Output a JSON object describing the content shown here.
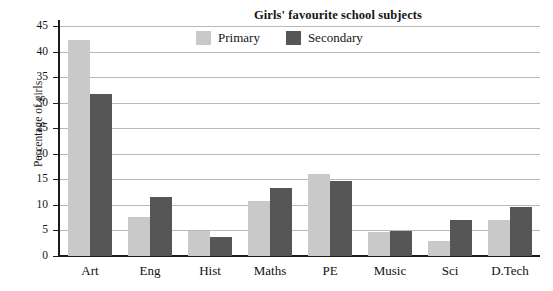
{
  "chart_data": {
    "type": "bar",
    "title": "Girls' favourite school subjects",
    "xlabel": "",
    "ylabel": "Percentage of girls",
    "categories": [
      "Art",
      "Eng",
      "Hist",
      "Maths",
      "PE",
      "Music",
      "Sci",
      "D.Tech"
    ],
    "series": [
      {
        "name": "Primary",
        "color": "#c9c9c9",
        "values": [
          42.3,
          7.7,
          4.9,
          10.8,
          16.1,
          4.7,
          3.0,
          7.1
        ]
      },
      {
        "name": "Secondary",
        "color": "#565656",
        "values": [
          31.7,
          11.5,
          3.8,
          13.4,
          14.7,
          4.8,
          7.1,
          9.5
        ]
      }
    ],
    "ylim": [
      0,
      45
    ],
    "ytick_step": 5,
    "ytick_labels": [
      "0",
      "5",
      "10",
      "15",
      "20",
      "25",
      "30",
      "35",
      "40",
      "45"
    ],
    "grid": true,
    "grid_axis": "y",
    "legend_position": "top-center",
    "bar_group_style": "grouped"
  }
}
